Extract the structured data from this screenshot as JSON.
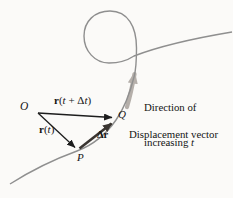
{
  "labels": {
    "origin": "O",
    "point_p": "P",
    "point_q": "Q",
    "vector_rt": {
      "r": "r",
      "open": "(",
      "t": "t",
      "close": ")"
    },
    "vector_rtdt": {
      "r": "r",
      "open": "(",
      "t1": "t",
      "plus": " + ",
      "delta": "Δ",
      "t2": "t",
      "close": ")"
    },
    "delta_r": "Δr",
    "direction_note": {
      "line1": "Direction of",
      "line2_word": "increasing ",
      "line2_t": "t"
    },
    "displacement_note": "Displacement vector"
  },
  "colors": {
    "background": "#fbfaf8",
    "curve": "#8f8f8f",
    "direction_arrow": "#a9a29d",
    "vector_stroke": "#1d1d1d",
    "displacement_stroke": "#3a3531",
    "text": "#141414"
  }
}
